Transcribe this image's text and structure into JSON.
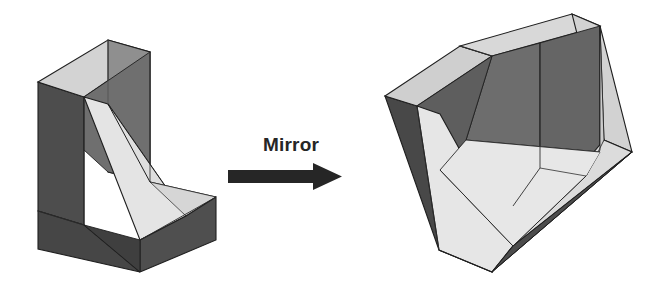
{
  "canvas": {
    "width": 666,
    "height": 287,
    "background": "#ffffff"
  },
  "annotation": {
    "label": "Mirror",
    "arrow_name": "right-arrow",
    "arrow_color": "#262626",
    "arrow_direction": "right"
  },
  "palette": {
    "dark_face": "#4a4a4a",
    "dark_face_alt": "#525252",
    "mid_face": "#8c8c8c",
    "mid_face_alt": "#7d7d7d",
    "light_face": "#d9d9d9",
    "lighter_face": "#e8e8e8",
    "highlight_face": "#efefef",
    "outline": "#1f1f1f"
  },
  "shapes": [
    {
      "id": "left-object",
      "name": "angle-block-original",
      "caption": "",
      "description": "Isometric L-shaped angle block with chamfered inner corner, seen from front-left",
      "role": "source"
    },
    {
      "id": "right-object",
      "name": "angle-block-mirrored",
      "caption": "",
      "description": "Mirror image of the angle block, shown as an open tray / box with chamfered inner edges",
      "role": "mirrored"
    }
  ],
  "geometry": {
    "left": {
      "top_face": "38,82 108,40 146,50 84,96",
      "back_outer_left": "38,82 84,96 84,224 38,210",
      "back_inner_right": "146,50 146,178 84,224 84,96",
      "back_top_right": "108,40 146,50 146,178 108,170",
      "chamfer": "84,96 146,178 178,212 66,160",
      "floor": "146,178 216,196 140,240 78,214",
      "front_rim_top": "78,214 140,240 216,196 216,196",
      "front_left_face": "38,210 84,224 140,272 38,248",
      "front_right_face": "140,272 216,240 216,196 140,240"
    },
    "right": {
      "apex_top": "572,14",
      "left_corner": "385,96",
      "bottom_apex": "492,272",
      "right_corner": "632,152"
    }
  }
}
